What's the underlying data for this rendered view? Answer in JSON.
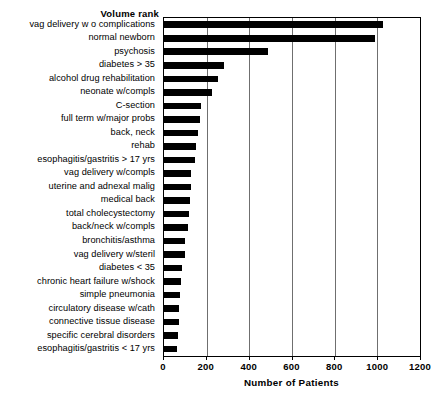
{
  "chart_data": {
    "type": "bar",
    "orientation": "horizontal",
    "title": "Volume rank",
    "xlabel": "Number of Patients",
    "ylabel": "",
    "xlim": [
      0,
      1200
    ],
    "xticks": [
      0,
      200,
      400,
      600,
      800,
      1000,
      1200
    ],
    "xticklabels": [
      "0",
      "200",
      "400",
      "600",
      "800",
      "1000",
      "1200"
    ],
    "grid": "vertical",
    "legend": "none",
    "bar_color": "#000000",
    "categories": [
      "vag delivery w o complications",
      "normal newborn",
      "psychosis",
      "diabetes > 35",
      "alcohol drug rehabilitation",
      "neonate w/compls",
      "C-section",
      "full term w/major probs",
      "back, neck",
      "rehab",
      "esophagitis/gastritis > 17 yrs",
      "vag delivery w/compls",
      "uterine and adnexal malig",
      "medical back",
      "total cholecystectomy",
      "back/neck w/compls",
      "bronchitis/asthma",
      "vag delivery w/steril",
      "diabetes < 35",
      "chronic heart failure w/shock",
      "simple pneumonia",
      "circulatory disease w/cath",
      "connective tissue disease",
      "specific cerebral disorders",
      "esophagitis/gastritis < 17 yrs"
    ],
    "values": [
      1025,
      990,
      487,
      282,
      252,
      225,
      175,
      168,
      158,
      150,
      145,
      128,
      125,
      120,
      115,
      112,
      100,
      98,
      85,
      80,
      75,
      72,
      68,
      65,
      60
    ]
  }
}
